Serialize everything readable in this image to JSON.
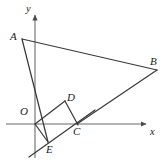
{
  "figure": {
    "kind": "coordinate-geometry-diagram",
    "width": 166,
    "height": 164,
    "background_color": "#ffffff",
    "stroke_color": "#3a3a3a",
    "axis_color": "#8a8a8a",
    "label_color": "#1a1a1a"
  },
  "axes": {
    "x_label": "x",
    "y_label": "y",
    "origin_label": "O",
    "x_axis": {
      "x1": 6,
      "y1": 124,
      "x2": 150,
      "y2": 124
    },
    "y_axis": {
      "x1": 35,
      "y1": 11,
      "x2": 35,
      "y2": 158
    },
    "x_label_pos": {
      "x": 150,
      "y": 128
    },
    "y_label_pos": {
      "x": 26,
      "y": 4
    },
    "origin_label_pos": {
      "x": 21,
      "y": 107
    }
  },
  "points": [
    {
      "name": "A",
      "label": "A",
      "x": 22,
      "y": 39,
      "label_x": 11,
      "label_y": 32
    },
    {
      "name": "B",
      "label": "B",
      "x": 157,
      "y": 70,
      "label_x": 150,
      "label_y": 57
    },
    {
      "name": "C",
      "label": "C",
      "x": 77,
      "y": 124,
      "label_x": 74,
      "label_y": 127
    },
    {
      "name": "D",
      "label": "D",
      "x": 65,
      "y": 101,
      "label_x": 67,
      "label_y": 93
    },
    {
      "name": "E",
      "label": "E",
      "x": 48,
      "y": 142,
      "label_x": 47,
      "label_y": 145
    },
    {
      "name": "O",
      "label": "O",
      "x": 35,
      "y": 124,
      "label_x": 21,
      "label_y": 107
    }
  ],
  "segments": [
    {
      "name": "segment-AB",
      "from": "A",
      "to": "B",
      "x1": 22,
      "y1": 39,
      "x2": 157,
      "y2": 70
    },
    {
      "name": "segment-BC",
      "from": "B",
      "to": "C",
      "x1": 157,
      "y1": 70,
      "x2": 77,
      "y2": 124
    },
    {
      "name": "line-A-through-D-to-E",
      "from": "A",
      "to": "E",
      "x1": 22,
      "y1": 39,
      "x2": 48,
      "y2": 142
    },
    {
      "name": "segment-OD",
      "from": "O",
      "to": "D",
      "x1": 35,
      "y1": 124,
      "x2": 65,
      "y2": 101
    },
    {
      "name": "segment-OE",
      "from": "O",
      "to": "E",
      "x1": 35,
      "y1": 124,
      "x2": 48,
      "y2": 142
    },
    {
      "name": "line-E-through-C-extended",
      "from": "lower-left",
      "to": "upper-right",
      "x1": 29,
      "y1": 157,
      "x2": 93,
      "y2": 112
    },
    {
      "name": "segment-DC",
      "from": "D",
      "to": "C",
      "x1": 65,
      "y1": 101,
      "x2": 77,
      "y2": 124
    }
  ]
}
